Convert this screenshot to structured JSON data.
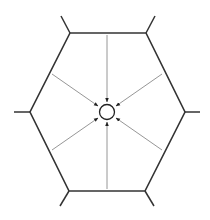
{
  "diagram": {
    "colors": {
      "background": "#ffffff",
      "hexagon": "#333333",
      "arrows": "#8a8a8a",
      "arrowheads": "#222222",
      "circle": "#222222"
    },
    "hexagon": {
      "vertices": [
        [
          70,
          33
        ],
        [
          146,
          33
        ],
        [
          185,
          112
        ],
        [
          145,
          191
        ],
        [
          69,
          191
        ],
        [
          30,
          112
        ]
      ],
      "spokes": [
        [
          [
            70,
            33
          ],
          [
            61,
            16
          ]
        ],
        [
          [
            146,
            33
          ],
          [
            155,
            16
          ]
        ],
        [
          [
            185,
            112
          ],
          [
            200,
            112
          ]
        ],
        [
          [
            145,
            191
          ],
          [
            154,
            206
          ]
        ],
        [
          [
            69,
            191
          ],
          [
            60,
            206
          ]
        ],
        [
          [
            30,
            112
          ],
          [
            14,
            112
          ]
        ]
      ]
    },
    "center_circle": {
      "cx": 107,
      "cy": 112,
      "r": 7.5
    },
    "arrows": [
      {
        "from": [
          107,
          35
        ],
        "to": [
          107,
          102
        ]
      },
      {
        "from": [
          162,
          74
        ],
        "to": [
          116,
          106
        ]
      },
      {
        "from": [
          162,
          150
        ],
        "to": [
          116,
          118
        ]
      },
      {
        "from": [
          107,
          189
        ],
        "to": [
          107,
          122
        ]
      },
      {
        "from": [
          52,
          150
        ],
        "to": [
          98,
          118
        ]
      },
      {
        "from": [
          52,
          74
        ],
        "to": [
          98,
          106
        ]
      }
    ]
  }
}
